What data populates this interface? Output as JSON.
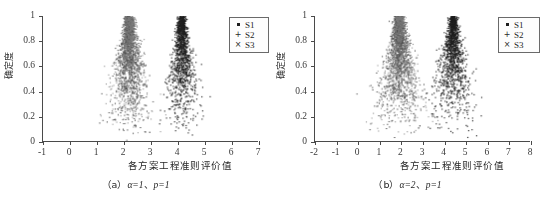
{
  "figure": {
    "panels": [
      {
        "id": "a",
        "caption_prefix": "（a）",
        "caption_alpha": "α=1",
        "caption_sep": "、",
        "caption_p": "p=1",
        "xlabel": "各方案工程准则评价值",
        "ylabel": "确定度",
        "legend": [
          {
            "label": "S1",
            "marker": "dot"
          },
          {
            "label": "S2",
            "marker": "+"
          },
          {
            "label": "S3",
            "marker": "×"
          }
        ]
      },
      {
        "id": "b",
        "caption_prefix": "（b）",
        "caption_alpha": "α=2",
        "caption_sep": "、",
        "caption_p": "p=1",
        "xlabel": "各方案工程准则评价值",
        "ylabel": "确定度",
        "legend": [
          {
            "label": "S1",
            "marker": "dot"
          },
          {
            "label": "S2",
            "marker": "+"
          },
          {
            "label": "S3",
            "marker": "×"
          }
        ]
      }
    ]
  },
  "chart_data": [
    {
      "type": "scatter",
      "panel": "a",
      "title": "（a）α=1、p=1",
      "xlabel": "各方案工程准则评价值",
      "ylabel": "确定度",
      "xlim": [
        -1,
        7
      ],
      "ylim": [
        0,
        1
      ],
      "xticks": [
        -1,
        0,
        1,
        2,
        3,
        4,
        5,
        6,
        7
      ],
      "xticklabels": [
        "-1",
        "0",
        "1",
        "2",
        "3",
        "4",
        "5",
        "6",
        "7"
      ],
      "yticks": [
        0,
        0.2,
        0.4,
        0.6,
        0.8,
        1
      ],
      "yticklabels": [
        "0",
        "0.2",
        "0.4",
        "0.6",
        "0.8",
        "1"
      ],
      "grid": false,
      "legend_position": "top-right",
      "series": [
        {
          "name": "S1",
          "marker": "dot",
          "color": "#1f1f1f",
          "n_points": 1400,
          "cluster_peak_x": 4.15,
          "cluster_peak_y": 1.0,
          "spread_at_top": 0.16,
          "spread_at_bottom": 1.25,
          "density": "very-dense"
        },
        {
          "name": "S2",
          "marker": "+",
          "color": "#4a4a4a",
          "n_points": 1300,
          "cluster_peak_x": 2.2,
          "cluster_peak_y": 1.0,
          "spread_at_top": 0.18,
          "spread_at_bottom": 1.35,
          "density": "dense"
        },
        {
          "name": "S3",
          "marker": "×",
          "color": "#7a7a7a",
          "n_points": 900,
          "cluster_peak_x": 2.2,
          "cluster_peak_y": 1.0,
          "spread_at_top": 0.22,
          "spread_at_bottom": 1.5,
          "density": "sparse"
        }
      ]
    },
    {
      "type": "scatter",
      "panel": "b",
      "title": "（b）α=2、p=1",
      "xlabel": "各方案工程准则评价值",
      "ylabel": "确定度",
      "xlim": [
        -2,
        8
      ],
      "ylim": [
        0,
        1
      ],
      "xticks": [
        -2,
        -1,
        0,
        1,
        2,
        3,
        4,
        5,
        6,
        7,
        8
      ],
      "xticklabels": [
        "-2",
        "-1",
        "0",
        "1",
        "2",
        "3",
        "4",
        "5",
        "6",
        "7",
        "8"
      ],
      "yticks": [
        0,
        0.2,
        0.4,
        0.6,
        0.8,
        1
      ],
      "yticklabels": [
        "0",
        "0.2",
        "0.4",
        "0.6",
        "0.8",
        "1"
      ],
      "grid": false,
      "legend_position": "top-right",
      "series": [
        {
          "name": "S1",
          "marker": "dot",
          "color": "#1f1f1f",
          "n_points": 1500,
          "cluster_peak_x": 4.4,
          "cluster_peak_y": 1.0,
          "spread_at_top": 0.2,
          "spread_at_bottom": 2.0,
          "density": "very-dense"
        },
        {
          "name": "S2",
          "marker": "+",
          "color": "#4a4a4a",
          "n_points": 1350,
          "cluster_peak_x": 1.9,
          "cluster_peak_y": 1.0,
          "spread_at_top": 0.22,
          "spread_at_bottom": 2.1,
          "density": "dense"
        },
        {
          "name": "S3",
          "marker": "×",
          "color": "#7a7a7a",
          "n_points": 950,
          "cluster_peak_x": 1.9,
          "cluster_peak_y": 1.0,
          "spread_at_top": 0.26,
          "spread_at_bottom": 2.3,
          "density": "sparse"
        }
      ]
    }
  ]
}
